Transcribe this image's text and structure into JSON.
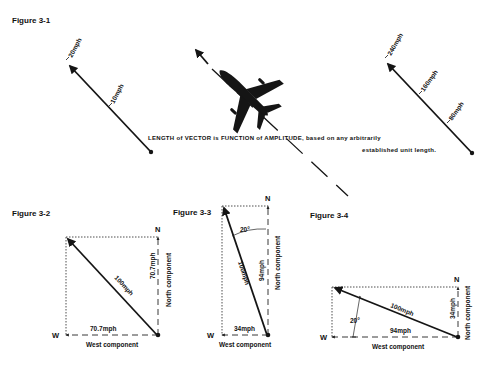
{
  "figures": {
    "fig1": {
      "title": "Figure 3-1",
      "left_vector": {
        "labels": [
          "20mph",
          "10mph"
        ]
      },
      "right_vector": {
        "labels": [
          "240mph",
          "160mph",
          "80mph"
        ]
      },
      "caption_line1": "LENGTH of VECTOR is FUNCTION of AMPLITUDE, based on any arbitrarily",
      "caption_line2": "established unit length."
    },
    "fig2": {
      "title": "Figure 3-2",
      "north": "N",
      "west": "W",
      "resultant": "100mph",
      "north_value": "70.7mph",
      "north_label": "North component",
      "west_value": "70.7mph",
      "west_label": "West component"
    },
    "fig3": {
      "title": "Figure 3-3",
      "north": "N",
      "west": "W",
      "angle": "20°",
      "resultant": "100mph",
      "north_value": "94mph",
      "north_label": "North component",
      "west_value": "34mph",
      "west_label": "West component"
    },
    "fig4": {
      "title": "Figure 3-4",
      "north": "N",
      "west": "W",
      "angle": "20°",
      "resultant": "100mph",
      "north_value": "34mph",
      "north_label": "North component",
      "west_value": "94mph",
      "west_label": "West component"
    }
  },
  "icons": {
    "aircraft": "airplane-silhouette-icon"
  },
  "colors": {
    "ink": "#151515",
    "background": "#ffffff"
  }
}
